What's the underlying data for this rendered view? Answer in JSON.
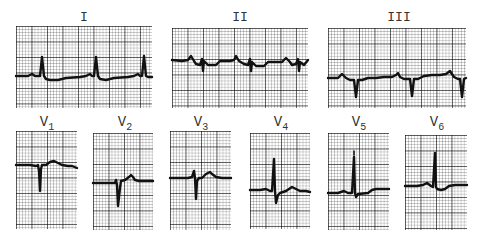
{
  "figure": {
    "limb_leads": [
      {
        "id": "I",
        "label": "I"
      },
      {
        "id": "II",
        "label": "II"
      },
      {
        "id": "III",
        "label": "III"
      }
    ],
    "precordial_leads": [
      {
        "id": "V1",
        "label": "V",
        "sub": "1"
      },
      {
        "id": "V2",
        "label": "V",
        "sub": "2"
      },
      {
        "id": "V3",
        "label": "V",
        "sub": "3"
      },
      {
        "id": "V4",
        "label": "V",
        "sub": "4"
      },
      {
        "id": "V5",
        "label": "V",
        "sub": "5"
      },
      {
        "id": "V6",
        "label": "V",
        "sub": "6"
      }
    ],
    "colors": {
      "trace": "#111111",
      "grid_major": "#8c8c8c",
      "grid_minor": "#c8c8c8",
      "background": "#ffffff"
    }
  }
}
